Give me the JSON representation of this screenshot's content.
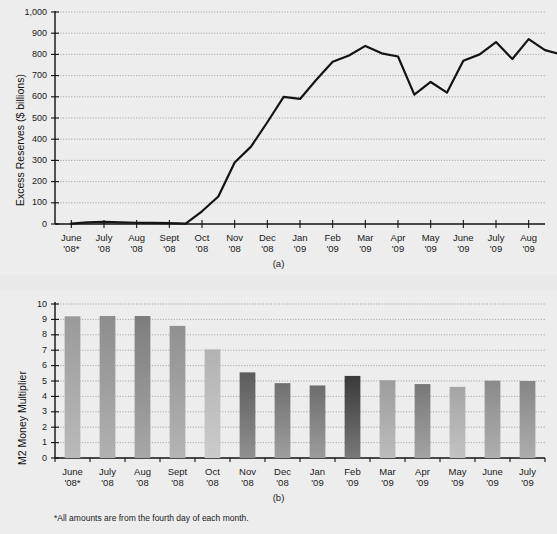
{
  "figure": {
    "footnote": "*All amounts are from the fourth day of each month.",
    "panel_a_caption": "(a)",
    "panel_b_caption": "(b)"
  },
  "chart_data": [
    {
      "id": "panel-a",
      "type": "line",
      "title": "",
      "caption": "(a)",
      "xlabel": "",
      "ylabel": "Excess Reserves ($ billions)",
      "ylim": [
        0,
        1000
      ],
      "ytick_labels": [
        "0",
        "100",
        "200",
        "300",
        "400",
        "500",
        "600",
        "700",
        "800",
        "900",
        "1,000"
      ],
      "yticks": [
        0,
        100,
        200,
        300,
        400,
        500,
        600,
        700,
        800,
        900,
        1000
      ],
      "grid": true,
      "legend": "none",
      "categories": [
        "June '08*",
        "July '08",
        "Aug '08",
        "Sept '08",
        "Oct '08",
        "Nov '08",
        "Dec '08",
        "Jan '09",
        "Feb '09",
        "Mar '09",
        "Apr '09",
        "May '09",
        "June '09",
        "July '09",
        "Aug '09"
      ],
      "x": [
        0,
        0.5,
        1,
        1.5,
        2,
        2.5,
        3,
        3.5,
        4,
        4.5,
        5,
        5.5,
        6,
        6.5,
        7,
        7.5,
        8,
        8.5,
        9,
        9.5,
        10,
        10.5,
        11,
        11.5,
        12,
        12.5,
        13,
        13.5,
        14
      ],
      "values": [
        2,
        8,
        10,
        8,
        6,
        5,
        4,
        2,
        60,
        130,
        290,
        365,
        480,
        600,
        590,
        680,
        765,
        795,
        840,
        805,
        790,
        610,
        670,
        620,
        770,
        800,
        858,
        778,
        872
      ],
      "values_tail": [
        820,
        800,
        685,
        733,
        722,
        705,
        785
      ],
      "note": "Semi-monthly observations; excess reserves in $ billions"
    },
    {
      "id": "panel-b",
      "type": "bar",
      "title": "",
      "caption": "(b)",
      "xlabel": "",
      "ylabel": "M2 Money Multiplier",
      "ylim": [
        0,
        10
      ],
      "ytick_labels": [
        "0",
        "1",
        "2",
        "3",
        "4",
        "5",
        "6",
        "7",
        "8",
        "9",
        "10"
      ],
      "yticks": [
        0,
        1,
        2,
        3,
        4,
        5,
        6,
        7,
        8,
        9,
        10
      ],
      "grid": true,
      "legend": "none",
      "categories": [
        "June '08*",
        "July '08",
        "Aug '08",
        "Sept '08",
        "Oct '08",
        "Nov '08",
        "Dec '08",
        "Jan '09",
        "Feb '09",
        "Mar '09",
        "Apr '09",
        "May '09",
        "June '09",
        "July '09"
      ],
      "values": [
        9.2,
        9.22,
        9.22,
        8.58,
        7.05,
        5.56,
        4.86,
        4.71,
        5.33,
        5.05,
        4.8,
        4.62,
        5.02,
        5.0
      ],
      "bar_colors": [
        "#9a9a9a",
        "#8d8d8d",
        "#7d7d7d",
        "#909090",
        "#b2b2b2",
        "#5c5c5c",
        "#707070",
        "#6d6d6d",
        "#3a3a3a",
        "#9d9d9d",
        "#787878",
        "#a5a5a5",
        "#8a8a8a",
        "#868686"
      ]
    }
  ],
  "palette": {
    "page_background": "#e9e9e9",
    "plot_background": "#ededed",
    "axis": "#111111",
    "grid": "#7a7a7a",
    "line": "#141414"
  }
}
